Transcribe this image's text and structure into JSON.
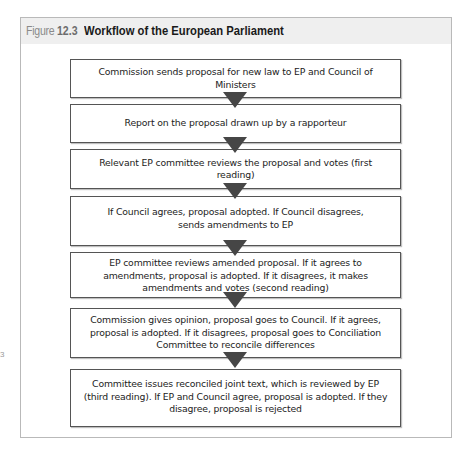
{
  "figure": {
    "label_word": "Figure",
    "number": "12.3",
    "title": "Workflow of the European Parliament"
  },
  "margin_fragment": "3",
  "steps": [
    {
      "text": "Commission sends proposal for new law to EP and Council of Ministers"
    },
    {
      "text": "Report on the proposal drawn up by a rapporteur"
    },
    {
      "text": "Relevant EP committee reviews the proposal and votes (first reading)"
    },
    {
      "text": "If Council agrees, proposal adopted. If Council disagrees, sends amendments to EP"
    },
    {
      "text": "EP committee reviews amended proposal. If it agrees to amendments, proposal is adopted. If it disagrees, it makes amendments and votes (second reading)"
    },
    {
      "text": "Commission gives opinion, proposal goes to Council. If it agrees, proposal is adopted. If it disagrees, proposal goes to Conciliation Committee to reconcile differences"
    },
    {
      "text": "Committee issues reconciled joint text, which is reviewed by EP (third reading). If EP and Council agree, proposal is adopted. If they disagree, proposal is rejected"
    }
  ],
  "colors": {
    "arrow": "#464646",
    "box_border": "#555555",
    "header_bg": "#efefef",
    "frame_border": "#b9b9b9"
  }
}
